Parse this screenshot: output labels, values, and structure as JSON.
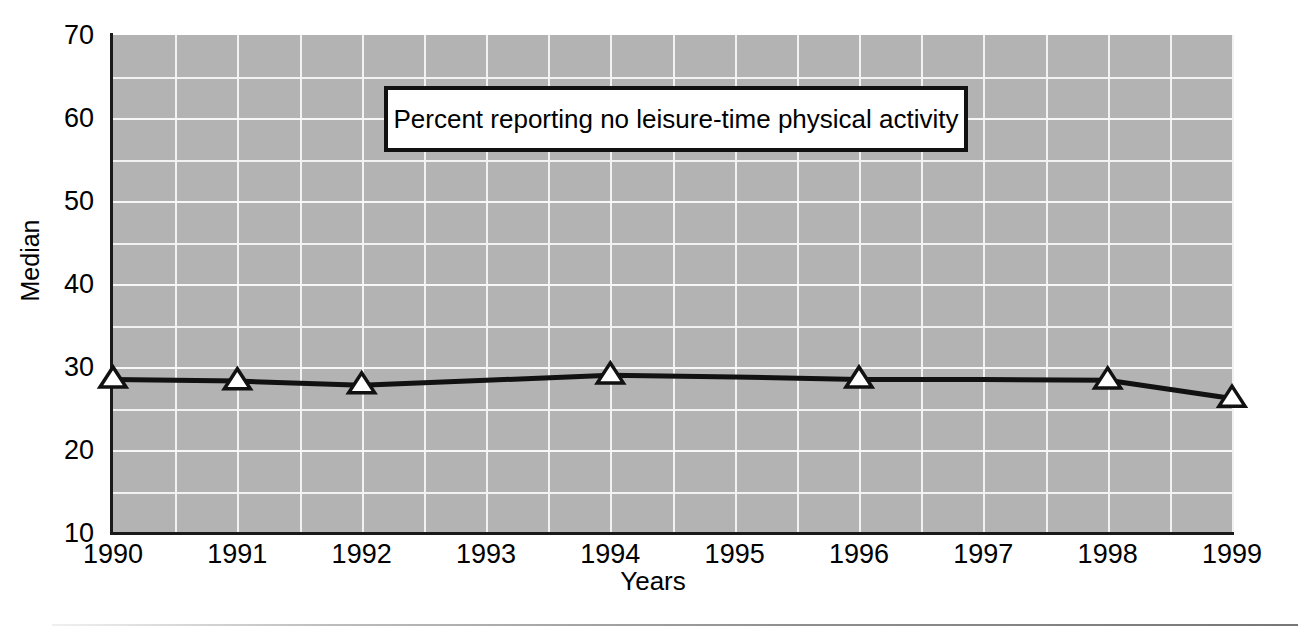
{
  "chart_data": {
    "type": "line",
    "title": "Percent reporting no leisure-time physical activity",
    "xlabel": "Years",
    "ylabel": "Median",
    "x": [
      1990,
      1991,
      1992,
      1993,
      1994,
      1995,
      1996,
      1997,
      1998,
      1999
    ],
    "categories": [
      "1990",
      "1991",
      "1992",
      "1993",
      "1994",
      "1995",
      "1996",
      "1997",
      "1998",
      "1999"
    ],
    "series": [
      {
        "name": "Percent reporting no leisure-time physical activity",
        "values": [
          28.5,
          28.3,
          27.8,
          28.4,
          29.0,
          28.8,
          28.5,
          28.5,
          28.4,
          26.2
        ],
        "marker": "triangle-up",
        "marker_face_color": "#ffffff",
        "marker_edge_color": "#111111",
        "line_color": "#111111"
      }
    ],
    "marker_years": [
      1990,
      1991,
      1992,
      1994,
      1996,
      1998,
      1999
    ],
    "xlim": [
      1990,
      1999
    ],
    "ylim": [
      10,
      70
    ],
    "ytick_labels": [
      "70",
      "60",
      "50",
      "40",
      "30",
      "20",
      "10"
    ],
    "ytick_values": [
      70,
      60,
      50,
      40,
      30,
      20,
      10
    ],
    "yminor_values": [
      65,
      55,
      45,
      35,
      25,
      15
    ],
    "grid": true,
    "grid_color": "#f2f2f2",
    "plot_background": "#b3b3b3",
    "legend_position": "inside-top-center"
  },
  "axis": {
    "y_title": "Median",
    "x_title": "Years"
  },
  "legend": {
    "label": "Percent reporting no leisure-time physical activity"
  },
  "colors": {
    "plot_bg": "#b3b3b3",
    "grid": "#f2f2f2",
    "axis": "#1a1a1a",
    "line": "#111111",
    "marker_fill": "#ffffff",
    "page_bg": "#ffffff"
  }
}
